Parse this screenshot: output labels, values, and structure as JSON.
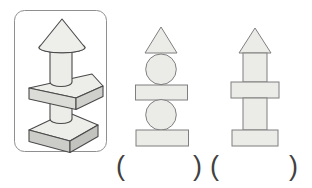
{
  "exercise": {
    "kind": "match-3d-structure-to-flat-shapes",
    "reference_figure": {
      "name": "3d-tower",
      "parts_top_to_bottom": [
        "cone",
        "cylinder",
        "triangular-prism-slab",
        "cylinder",
        "rectangular-box"
      ]
    },
    "options": [
      {
        "id": 1,
        "shapes_top_to_bottom": [
          "triangle",
          "circle",
          "rectangle",
          "circle",
          "rectangle"
        ]
      },
      {
        "id": 2,
        "shapes_top_to_bottom": [
          "triangle",
          "rectangle",
          "rectangle",
          "rectangle",
          "rectangle"
        ]
      }
    ]
  },
  "answer_slot": {
    "open_paren": "(",
    "close_paren": ")"
  },
  "colors": {
    "background": "#ffffff",
    "panel_border": "#8f8f8f",
    "outline_3d": "#4a4a4a",
    "face_top": "#ededea",
    "box_front": "#ccccc9",
    "box_side": "#c2c2bf",
    "slab_front": "#dbdbd8",
    "slab_side": "#cfcfcc",
    "cylinder_fill": "#ecece9",
    "cone_fill": "#eeeeeb",
    "shape_fill_2d": "#ebebe8",
    "shape_stroke_2d": "#7f7f7f",
    "paren_color": "#414141"
  }
}
